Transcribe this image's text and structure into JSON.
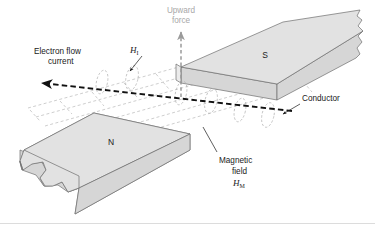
{
  "figure": {
    "title_alt": "Current-carrying conductor in a magnetic field",
    "background_color": "#ffffff"
  },
  "labels": {
    "electron_flow_line1": "Electron flow",
    "electron_flow_line2": "current",
    "upward_force_line1": "Upward",
    "upward_force_line2": "force",
    "conductor": "Conductor",
    "magnetic_field_line1": "Magnetic",
    "magnetic_field_line2": "field",
    "current_field_symbol": "H",
    "current_field_subscript": "I",
    "magnet_field_symbol": "H",
    "magnet_field_subscript": "M",
    "north_pole": "N",
    "south_pole": "S"
  },
  "colors": {
    "magnet_face": "#e2e2e2",
    "magnet_side": "#d6d6d6",
    "magnet_end": "#ebebeb",
    "magnet_outline": "#6e6e6e",
    "field_line": "#b4b4b4",
    "loop": "#b0b0b0",
    "conductor": "#111111",
    "force_arrow": "#9a9a9a",
    "text": "#1a1a1a",
    "text_muted": "#a8a8a8"
  }
}
